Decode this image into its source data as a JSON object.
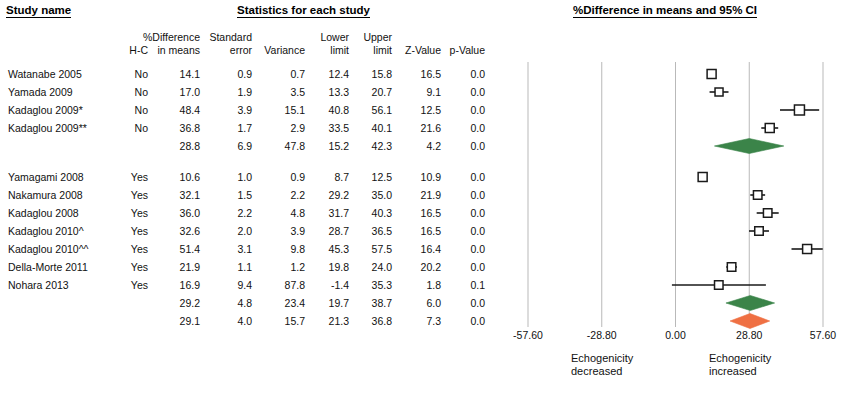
{
  "headers": {
    "study_name": "Study name",
    "statistics": "Statistics for each study",
    "plot": "%Difference in means and 95% CI"
  },
  "columns": {
    "hc": "H-C",
    "diff_l1": "%Difference",
    "diff_l2": "in means",
    "se_l1": "Standard",
    "se_l2": "error",
    "variance": "Variance",
    "lower_l1": "Lower",
    "lower_l2": "limit",
    "upper_l1": "Upper",
    "upper_l2": "limit",
    "zvalue": "Z-Value",
    "pvalue": "p-Value"
  },
  "axis": {
    "ticks": [
      "-57.60",
      "-28.80",
      "0.00",
      "28.80",
      "57.60"
    ],
    "tick_values": [
      -57.6,
      -28.8,
      0,
      28.8,
      57.6
    ],
    "min": -57.6,
    "max": 57.6,
    "left_caption_l1": "Echogenicity",
    "left_caption_l2": "decreased",
    "right_caption_l1": "Echogenicity",
    "right_caption_l2": "increased"
  },
  "colors": {
    "summary_green": "#3b8449",
    "summary_orange": "#ef7043",
    "gridline": "#b9b9b9",
    "marker_stroke": "#1a1a1a",
    "text": "#111111"
  },
  "rows": [
    {
      "study": "Watanabe 2005",
      "hc": "No",
      "diff": "14.1",
      "se": "0.9",
      "var": "0.7",
      "lower": "12.4",
      "upper": "15.8",
      "z": "16.5",
      "p": "0.0",
      "kind": "study",
      "d": 14.1,
      "lo": 12.4,
      "hi": 15.8,
      "box": 9.0
    },
    {
      "study": "Yamada 2009",
      "hc": "No",
      "diff": "17.0",
      "se": "1.9",
      "var": "3.5",
      "lower": "13.3",
      "upper": "20.7",
      "z": "9.1",
      "p": "0.0",
      "kind": "study",
      "d": 17.0,
      "lo": 13.3,
      "hi": 20.7,
      "box": 8.0
    },
    {
      "study": "Kadaglou 2009*",
      "hc": "No",
      "diff": "48.4",
      "se": "3.9",
      "var": "15.1",
      "lower": "40.8",
      "upper": "56.1",
      "z": "12.5",
      "p": "0.0",
      "kind": "study",
      "d": 48.4,
      "lo": 40.8,
      "hi": 56.1,
      "box": 10.0
    },
    {
      "study": "Kadaglou 2009**",
      "hc": "No",
      "diff": "36.8",
      "se": "1.7",
      "var": "2.9",
      "lower": "33.5",
      "upper": "40.1",
      "z": "21.6",
      "p": "0.0",
      "kind": "study",
      "d": 36.8,
      "lo": 33.5,
      "hi": 40.1,
      "box": 9.0
    },
    {
      "study": "",
      "hc": "",
      "diff": "28.8",
      "se": "6.9",
      "var": "47.8",
      "lower": "15.2",
      "upper": "42.3",
      "z": "4.2",
      "p": "0.0",
      "kind": "summary-green",
      "d": 28.8,
      "lo": 15.2,
      "hi": 42.3,
      "box": 0
    },
    {
      "study": "Yamagami 2008",
      "hc": "Yes",
      "diff": "10.6",
      "se": "1.0",
      "var": "0.9",
      "lower": "8.7",
      "upper": "12.5",
      "z": "10.9",
      "p": "0.0",
      "kind": "study",
      "d": 10.6,
      "lo": 8.7,
      "hi": 12.5,
      "box": 9.0
    },
    {
      "study": "Nakamura 2008",
      "hc": "Yes",
      "diff": "32.1",
      "se": "1.5",
      "var": "2.2",
      "lower": "29.2",
      "upper": "35.0",
      "z": "21.9",
      "p": "0.0",
      "kind": "study",
      "d": 32.1,
      "lo": 29.2,
      "hi": 35.0,
      "box": 8.5
    },
    {
      "study": "Kadaglou 2008",
      "hc": "Yes",
      "diff": "36.0",
      "se": "2.2",
      "var": "4.8",
      "lower": "31.7",
      "upper": "40.3",
      "z": "16.5",
      "p": "0.0",
      "kind": "study",
      "d": 36.0,
      "lo": 31.7,
      "hi": 40.3,
      "box": 8.5
    },
    {
      "study": "Kadaglou 2010^",
      "hc": "Yes",
      "diff": "32.6",
      "se": "2.0",
      "var": "3.9",
      "lower": "28.7",
      "upper": "36.5",
      "z": "16.5",
      "p": "0.0",
      "kind": "study",
      "d": 32.6,
      "lo": 28.7,
      "hi": 36.5,
      "box": 8.5
    },
    {
      "study": "Kadaglou 2010^^",
      "hc": "Yes",
      "diff": "51.4",
      "se": "3.1",
      "var": "9.8",
      "lower": "45.3",
      "upper": "57.5",
      "z": "16.4",
      "p": "0.0",
      "kind": "study",
      "d": 51.4,
      "lo": 45.3,
      "hi": 57.5,
      "box": 9.0
    },
    {
      "study": "Della-Morte 2011",
      "hc": "Yes",
      "diff": "21.9",
      "se": "1.1",
      "var": "1.2",
      "lower": "19.8",
      "upper": "24.0",
      "z": "20.2",
      "p": "0.0",
      "kind": "study",
      "d": 21.9,
      "lo": 19.8,
      "hi": 24.0,
      "box": 8.5
    },
    {
      "study": "Nohara 2013",
      "hc": "Yes",
      "diff": "16.9",
      "se": "9.4",
      "var": "87.8",
      "lower": "-1.4",
      "upper": "35.3",
      "z": "1.8",
      "p": "0.1",
      "kind": "study",
      "d": 16.9,
      "lo": -1.4,
      "hi": 35.3,
      "box": 8.5
    },
    {
      "study": "",
      "hc": "",
      "diff": "29.2",
      "se": "4.8",
      "var": "23.4",
      "lower": "19.7",
      "upper": "38.7",
      "z": "6.0",
      "p": "0.0",
      "kind": "summary-green",
      "d": 29.2,
      "lo": 19.7,
      "hi": 38.7,
      "box": 0
    },
    {
      "study": "",
      "hc": "",
      "diff": "29.1",
      "se": "4.0",
      "var": "15.7",
      "lower": "21.3",
      "upper": "36.8",
      "z": "7.3",
      "p": "0.0",
      "kind": "summary-orange",
      "d": 29.1,
      "lo": 21.3,
      "hi": 36.8,
      "box": 0
    }
  ],
  "chart_data": {
    "type": "scatter",
    "title": "%Difference in means and 95% CI",
    "xlabel": "%Difference in means",
    "ylabel": "Study name",
    "xlim": [
      -57.6,
      57.6
    ],
    "grid": true,
    "legend": "none",
    "xticks": [
      -57.6,
      -28.8,
      0,
      28.8,
      57.6
    ],
    "xticklabels": [
      "-57.60",
      "-28.80",
      "0.00",
      "28.80",
      "57.60"
    ],
    "annotations": [
      "Echogenicity decreased",
      "Echogenicity increased"
    ],
    "categories": [
      "Watanabe 2005",
      "Yamada 2009",
      "Kadaglou 2009*",
      "Kadaglou 2009**",
      "Subgroup H-C No",
      "Yamagami 2008",
      "Nakamura 2008",
      "Kadaglou 2008",
      "Kadaglou 2010^",
      "Kadaglou 2010^^",
      "Della-Morte 2011",
      "Nohara 2013",
      "Subgroup H-C Yes",
      "Overall"
    ],
    "values": [
      14.1,
      17.0,
      48.4,
      36.8,
      28.8,
      10.6,
      32.1,
      36.0,
      32.6,
      51.4,
      21.9,
      16.9,
      29.2,
      29.1
    ],
    "lower_limits": [
      12.4,
      13.3,
      40.8,
      33.5,
      15.2,
      8.7,
      29.2,
      31.7,
      28.7,
      45.3,
      19.8,
      -1.4,
      19.7,
      21.3
    ],
    "upper_limits": [
      15.8,
      20.7,
      56.1,
      40.1,
      42.3,
      12.5,
      35.0,
      40.3,
      36.5,
      57.5,
      24.0,
      35.3,
      38.7,
      36.8
    ],
    "standard_errors": [
      0.9,
      1.9,
      3.9,
      1.7,
      6.9,
      1.0,
      1.5,
      2.2,
      2.0,
      3.1,
      1.1,
      9.4,
      4.8,
      4.0
    ],
    "variances": [
      0.7,
      3.5,
      15.1,
      2.9,
      47.8,
      0.9,
      2.2,
      4.8,
      3.9,
      9.8,
      1.2,
      87.8,
      23.4,
      15.7
    ],
    "z_values": [
      16.5,
      9.1,
      12.5,
      21.6,
      4.2,
      10.9,
      21.9,
      16.5,
      16.5,
      16.4,
      20.2,
      1.8,
      6.0,
      7.3
    ],
    "p_values": [
      0.0,
      0.0,
      0.0,
      0.0,
      0.0,
      0.0,
      0.0,
      0.0,
      0.0,
      0.0,
      0.0,
      0.1,
      0.0,
      0.0
    ]
  },
  "layout": {
    "col_x": {
      "hc": 148,
      "diff": 200,
      "se": 252,
      "var": 305,
      "lower": 349,
      "upper": 392,
      "z": 441,
      "p": 485
    },
    "row_y": [
      68,
      86,
      104,
      122,
      140,
      171,
      189,
      207,
      225,
      243,
      261,
      279,
      297,
      315
    ],
    "plot": {
      "x0": 528,
      "x1": 823,
      "zero": 675.5
    }
  }
}
